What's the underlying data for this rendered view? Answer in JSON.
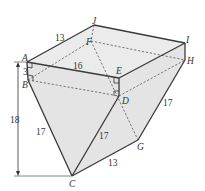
{
  "figure": {
    "type": "3D solid diagram",
    "points": {
      "A": {
        "label": "A",
        "x": 27,
        "y": 62
      },
      "B": {
        "label": "B",
        "x": 28,
        "y": 80
      },
      "C": {
        "label": "C",
        "x": 72,
        "y": 176
      },
      "D": {
        "label": "D",
        "x": 119,
        "y": 96
      },
      "E": {
        "label": "E",
        "x": 119,
        "y": 78
      },
      "F": {
        "label": "F",
        "x": 91,
        "y": 41
      },
      "G": {
        "label": "G",
        "x": 138,
        "y": 140
      },
      "H": {
        "label": "H",
        "x": 185,
        "y": 60
      },
      "I": {
        "label": "I",
        "x": 185,
        "y": 43
      },
      "J": {
        "label": "J",
        "x": 94,
        "y": 25
      }
    },
    "measurements": {
      "AJ": "13",
      "AE": "16",
      "AB": "3",
      "BC": "17",
      "DC": "17",
      "HG": "17",
      "CG": "13",
      "height": "18"
    },
    "right_angles": [
      "A",
      "B",
      "E",
      "D"
    ],
    "colors": {
      "stroke": "#3a3a3a",
      "face_fill": "#e4e4e4",
      "background": "#ffffff"
    }
  }
}
